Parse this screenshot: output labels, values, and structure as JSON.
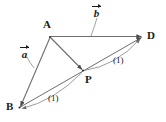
{
  "figure": {
    "background_color": "#ffffff",
    "stroke_color": "#555555",
    "label_color": "#1a1a1a",
    "width": 166,
    "height": 122,
    "points": [
      {
        "id": "A",
        "label": "A",
        "x": 50,
        "y": 37,
        "label_x": 43,
        "label_y": 19
      },
      {
        "id": "D",
        "label": "D",
        "x": 143,
        "y": 37,
        "label_x": 147,
        "label_y": 31
      },
      {
        "id": "B",
        "label": "B",
        "x": 19,
        "y": 108,
        "label_x": 7,
        "label_y": 103
      },
      {
        "id": "P",
        "label": "P",
        "x": 83,
        "y": 71,
        "label_x": 85,
        "label_y": 76
      }
    ],
    "segments": [
      {
        "id": "AD",
        "from": "A",
        "to": "D",
        "arrow": true
      },
      {
        "id": "AB",
        "from": "A",
        "to": "B",
        "arrow": true
      },
      {
        "id": "AP",
        "from": "A",
        "to": "P",
        "arrow": true
      },
      {
        "id": "BD",
        "from": "B",
        "to": "D",
        "arrow": true
      }
    ],
    "vector_labels": [
      {
        "id": "a",
        "glyph": "a",
        "x": 20,
        "y": 48,
        "leader_to_x": 34,
        "leader_to_y": 68
      },
      {
        "id": "b",
        "glyph": "b",
        "x": 93,
        "y": 6,
        "leader_to_x": 91,
        "leader_to_y": 36
      }
    ],
    "ratio_labels": [
      {
        "id": "ratio-pd",
        "text": "(1)",
        "x": 113,
        "y": 57
      },
      {
        "id": "ratio-bp",
        "text": "(1)",
        "x": 48,
        "y": 95
      }
    ],
    "arcs": [
      {
        "id": "arc-p-to-d",
        "from": "P",
        "to": "D",
        "annotation": "(1)"
      },
      {
        "id": "arc-p-to-b",
        "from": "P",
        "to": "B",
        "annotation": "(1)"
      }
    ]
  }
}
